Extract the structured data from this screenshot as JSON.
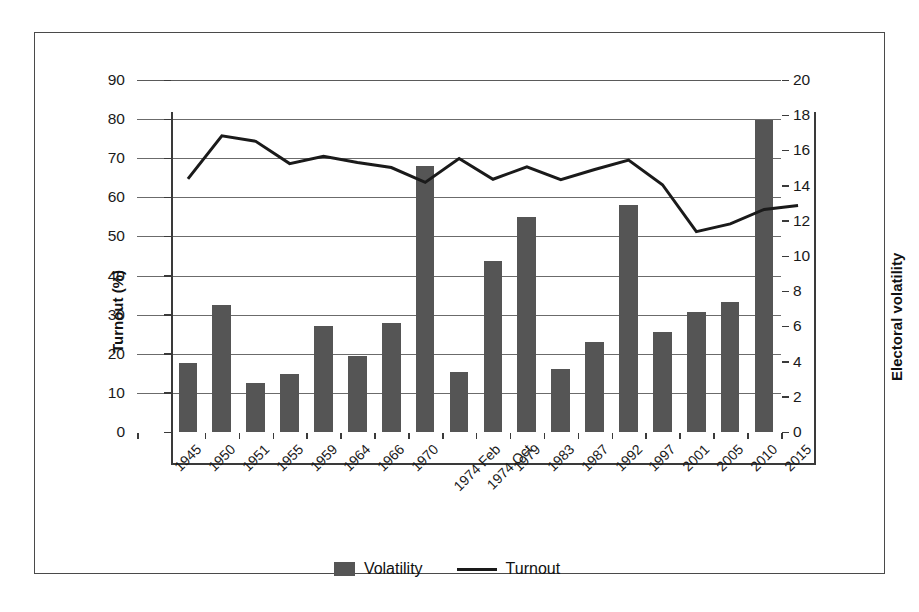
{
  "chart_data": {
    "type": "bar",
    "title": "",
    "categories": [
      "1945",
      "1950",
      "1951",
      "1955",
      "1959",
      "1964",
      "1966",
      "1970",
      "1974 Feb",
      "1974 Oct",
      "1979",
      "1983",
      "1987",
      "1992",
      "1997",
      "2001",
      "2005",
      "2010",
      "2015"
    ],
    "xlabel": "",
    "ylabel": "Turnout (%)",
    "ylabel_secondary": "Electoral volatility",
    "ylim": [
      0,
      90
    ],
    "ylim_secondary": [
      0,
      20
    ],
    "yticks": [
      0,
      10,
      20,
      30,
      40,
      50,
      60,
      70,
      80,
      90
    ],
    "yticks_secondary": [
      0,
      2,
      4,
      6,
      8,
      10,
      12,
      14,
      16,
      18,
      20
    ],
    "grid": true,
    "legend_position": "bottom",
    "series": [
      {
        "name": "Volatility",
        "type": "bar",
        "axis": "secondary",
        "color": "#555555",
        "values": [
          null,
          3.9,
          7.2,
          2.8,
          3.3,
          6.0,
          4.3,
          6.2,
          15.1,
          3.4,
          9.7,
          12.2,
          3.6,
          5.1,
          12.9,
          5.7,
          6.8,
          7.4,
          17.7
        ]
      },
      {
        "name": "Turnout",
        "type": "line",
        "axis": "primary",
        "color": "#1a1a1a",
        "values": [
          72.9,
          83.9,
          82.5,
          76.8,
          78.7,
          77.1,
          75.8,
          72.0,
          78.1,
          72.8,
          76.0,
          72.7,
          75.3,
          77.7,
          71.4,
          59.4,
          61.4,
          65.1,
          66.1
        ]
      }
    ]
  },
  "legend": {
    "entries": [
      {
        "label": "Volatility",
        "marker": "bar-swatch"
      },
      {
        "label": "Turnout",
        "marker": "line-swatch"
      }
    ]
  },
  "axes": {
    "left_title": "Turnout (%)",
    "right_title": "Electoral volatility",
    "left_ticks": [
      "90",
      "80",
      "70",
      "60",
      "50",
      "40",
      "30",
      "20",
      "10",
      "0"
    ],
    "right_ticks": [
      "20",
      "18",
      "16",
      "14",
      "12",
      "10",
      "8",
      "6",
      "4",
      "2",
      "0"
    ]
  }
}
